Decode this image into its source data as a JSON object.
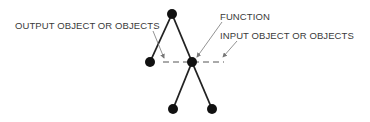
{
  "diagram": {
    "type": "tree-node-function-notation",
    "labels": {
      "output": "OUTPUT OBJECT OR OBJECTS",
      "function": "FUNCTION",
      "input": "INPUT OBJECT OR OBJECTS"
    },
    "nodes": [
      {
        "id": "top",
        "x": 172,
        "y": 14
      },
      {
        "id": "output-left",
        "x": 150,
        "y": 62
      },
      {
        "id": "function-center",
        "x": 192,
        "y": 62
      },
      {
        "id": "bottom-left",
        "x": 173,
        "y": 109
      },
      {
        "id": "bottom-right",
        "x": 212,
        "y": 109
      }
    ],
    "edges": [
      {
        "from": "top",
        "to": "output-left"
      },
      {
        "from": "top",
        "to": "function-center"
      },
      {
        "from": "function-center",
        "to": "bottom-left"
      },
      {
        "from": "function-center",
        "to": "bottom-right"
      }
    ],
    "dashed_line": {
      "x1": 163,
      "y1": 62,
      "x2": 224,
      "y2": 62
    },
    "colors": {
      "node": "#111111",
      "edge": "#222222",
      "dash": "#555555",
      "arrow": "#777777",
      "text": "#3a3a3a"
    }
  }
}
